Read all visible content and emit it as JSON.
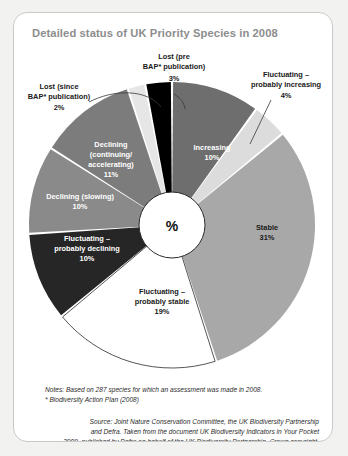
{
  "card": {
    "title": "Detailed status of UK Priority Species in 2008",
    "center_label": "%"
  },
  "chart_data": {
    "type": "pie",
    "title": "Detailed status of UK Priority Species in 2008",
    "unit": "%",
    "total_species": 287,
    "start_angle_deg": 0,
    "direction": "clockwise",
    "legend": "none-inline-labels",
    "categories": [
      "Increasing",
      "Fluctuating – probably increasing",
      "Stable",
      "Fluctuating – probably stable",
      "Fluctuating – probably declining",
      "Declining (slowing)",
      "Declining (continuing/accelerating)",
      "Lost (since BAP* publication)",
      "Lost (pre BAP* publication)"
    ],
    "values": [
      10,
      4,
      31,
      19,
      10,
      10,
      11,
      2,
      3
    ],
    "colors": [
      "#6e6e6e",
      "#dcdcdc",
      "#a8a8a8",
      "#ffffff",
      "#262626",
      "#8a8a8a",
      "#7c7c7c",
      "#e6e6e6",
      "#000000"
    ],
    "slices": [
      {
        "label": "Increasing",
        "value": 10,
        "value_text": "10%",
        "color": "#6e6e6e",
        "label_placement": "inside",
        "text_color": "#ffffff"
      },
      {
        "label": "Fluctuating – probably increasing",
        "value": 4,
        "value_text": "4%",
        "color": "#dcdcdc",
        "label_placement": "callout",
        "text_color": "#1a1a1a"
      },
      {
        "label": "Stable",
        "value": 31,
        "value_text": "31%",
        "color": "#a8a8a8",
        "label_placement": "inside",
        "text_color": "#1a1a1a"
      },
      {
        "label": "Fluctuating – probably stable",
        "value": 19,
        "value_text": "19%",
        "color": "#ffffff",
        "label_placement": "inside",
        "text_color": "#1a1a1a"
      },
      {
        "label": "Fluctuating – probably declining",
        "value": 10,
        "value_text": "10%",
        "color": "#262626",
        "label_placement": "inside",
        "text_color": "#ffffff"
      },
      {
        "label": "Declining (slowing)",
        "value": 10,
        "value_text": "10%",
        "color": "#8a8a8a",
        "label_placement": "inside",
        "text_color": "#ffffff"
      },
      {
        "label": "Declining (continuing/accelerating)",
        "value": 11,
        "value_text": "11%",
        "color": "#7c7c7c",
        "label_placement": "inside",
        "text_color": "#ffffff"
      },
      {
        "label": "Lost (since BAP* publication)",
        "value": 2,
        "value_text": "2%",
        "color": "#e6e6e6",
        "label_placement": "callout",
        "text_color": "#1a1a1a"
      },
      {
        "label": "Lost (pre BAP* publication)",
        "value": 3,
        "value_text": "3%",
        "color": "#000000",
        "label_placement": "callout",
        "text_color": "#1a1a1a"
      }
    ]
  },
  "labels": {
    "increasing_l1": "Increasing",
    "increasing_pct": "10%",
    "stable_l1": "Stable",
    "stable_pct": "31%",
    "fluct_stable_l1": "Fluctuating –",
    "fluct_stable_l2": "probably stable",
    "fluct_stable_pct": "19%",
    "fluct_decl_l1": "Fluctuating –",
    "fluct_decl_l2": "probably declining",
    "fluct_decl_pct": "10%",
    "decl_slow_l1": "Declining (slowing)",
    "decl_slow_pct": "10%",
    "decl_cont_l1": "Declining",
    "decl_cont_l2": "(continuing/",
    "decl_cont_l3": "accelerating)",
    "decl_cont_pct": "11%",
    "lost_pre_l1": "Lost (pre",
    "lost_pre_l2": "BAP* publication)",
    "lost_pre_pct": "3%",
    "lost_since_l1": "Lost (since",
    "lost_since_l2": "BAP* publication)",
    "lost_since_pct": "2%",
    "fluct_incr_l1": "Fluctuating –",
    "fluct_incr_l2": "probably increasing",
    "fluct_incr_pct": "4%"
  },
  "notes": {
    "line1": "Notes: Based on 287 species for which an assessment was made in 2008.",
    "line2": "* Biodiversity Action Plan (2008)"
  },
  "source": {
    "line1": "Source: Joint Nature Conservation Committee, the UK Biodiversity Partnership",
    "line2": "and Defra. Taken from the document UK Biodiversity Indicators in Your Pocket",
    "line3": "2009, published by Defra on behalf of the UK Biodiversity Partnership. Crown copyright."
  }
}
